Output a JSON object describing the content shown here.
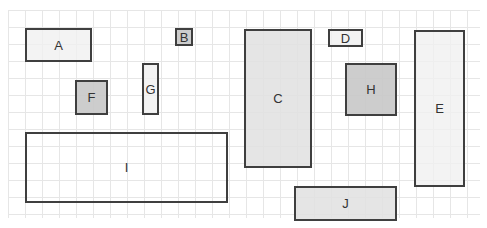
{
  "diagram": {
    "grid": {
      "cell_size_px": 17,
      "line_color": "#e6e6e6"
    },
    "boxes": [
      {
        "label": "A",
        "x": 25,
        "y": 28,
        "w": 67,
        "h": 34,
        "fill": "light"
      },
      {
        "label": "B",
        "x": 175,
        "y": 28,
        "w": 18,
        "h": 18,
        "fill": "dark"
      },
      {
        "label": "C",
        "x": 244,
        "y": 29,
        "w": 68,
        "h": 139,
        "fill": "mid"
      },
      {
        "label": "D",
        "x": 328,
        "y": 29,
        "w": 35,
        "h": 18,
        "fill": "light"
      },
      {
        "label": "E",
        "x": 414,
        "y": 30,
        "w": 51,
        "h": 157,
        "fill": "light"
      },
      {
        "label": "F",
        "x": 75,
        "y": 80,
        "w": 33,
        "h": 35,
        "fill": "dark"
      },
      {
        "label": "G",
        "x": 142,
        "y": 63,
        "w": 17,
        "h": 52,
        "fill": "light"
      },
      {
        "label": "H",
        "x": 345,
        "y": 63,
        "w": 52,
        "h": 53,
        "fill": "dark"
      },
      {
        "label": "I",
        "x": 25,
        "y": 132,
        "w": 203,
        "h": 71,
        "fill": "clear"
      },
      {
        "label": "J",
        "x": 294,
        "y": 186,
        "w": 103,
        "h": 35,
        "fill": "mid"
      }
    ]
  }
}
